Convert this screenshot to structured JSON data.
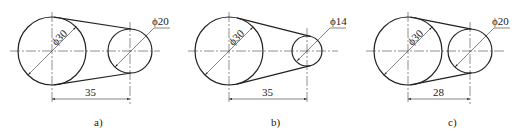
{
  "figures": [
    {
      "id": "a",
      "caption": "a)",
      "large": {
        "cx": 52,
        "cy": 51,
        "r": 34,
        "label": "ϕ30"
      },
      "small": {
        "cx": 130,
        "cy": 51,
        "r": 22,
        "label": "ϕ20"
      },
      "center_distance": "35"
    },
    {
      "id": "b",
      "caption": "b)",
      "large": {
        "cx": 229,
        "cy": 51,
        "r": 34,
        "label": "ϕ30"
      },
      "small": {
        "cx": 307,
        "cy": 51,
        "r": 15,
        "label": "ϕ14"
      },
      "center_distance": "35"
    },
    {
      "id": "c",
      "caption": "c)",
      "large": {
        "cx": 408,
        "cy": 51,
        "r": 34,
        "label": "ϕ30"
      },
      "small": {
        "cx": 470,
        "cy": 51,
        "r": 22,
        "label": "ϕ20"
      },
      "center_distance": "28"
    }
  ],
  "colors": {
    "line": "#222222",
    "background": "#ffffff"
  }
}
